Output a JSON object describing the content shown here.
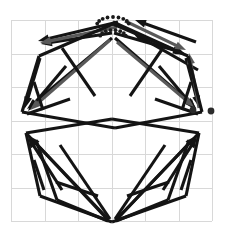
{
  "figure": {
    "width": 225,
    "height": 243,
    "background_color": "#ffffff"
  },
  "chart_data": {
    "type": "diagram",
    "xlabel": "",
    "ylabel": "",
    "grid": true,
    "grid_color": "#d8d8d8",
    "grid_spacing_px": 33.5,
    "grid_origin": [
      11,
      20
    ],
    "grid_cols": 6,
    "grid_rows": 6,
    "colors": {
      "primary_stroke": "#141414",
      "secondary_stroke": "#595959",
      "marker": "#2b2b2b",
      "grid": "#d8d8d8",
      "background": "#ffffff"
    },
    "vertices": [
      {
        "id": "top",
        "x": 113,
        "y": 24
      },
      {
        "id": "upper-left",
        "x": 39,
        "y": 56
      },
      {
        "id": "upper-right",
        "x": 188,
        "y": 56
      },
      {
        "id": "left",
        "x": 22,
        "y": 112
      },
      {
        "id": "right",
        "x": 202,
        "y": 112
      },
      {
        "id": "mid-left",
        "x": 26,
        "y": 133
      },
      {
        "id": "mid-right",
        "x": 199,
        "y": 133
      },
      {
        "id": "lower-left",
        "x": 40,
        "y": 196
      },
      {
        "id": "lower-right",
        "x": 186,
        "y": 196
      },
      {
        "id": "bottom",
        "x": 112,
        "y": 222
      }
    ],
    "markers": [
      {
        "id": "dot-right-inner",
        "x": 193,
        "y": 110,
        "r": 3.4,
        "color": "#2b2b2b"
      },
      {
        "id": "dot-right-outer",
        "x": 211,
        "y": 111,
        "r": 3.4,
        "color": "#2b2b2b"
      }
    ],
    "arcs": [
      {
        "id": "apex-arc-outer",
        "cx": 113,
        "cy": 25,
        "rx": 16,
        "ry": 8,
        "style": "dotted",
        "dots": 9
      },
      {
        "id": "apex-arc-inner",
        "cx": 113,
        "cy": 37,
        "rx": 13,
        "ry": 7,
        "style": "dotted",
        "dots": 8
      }
    ],
    "series": [
      {
        "name": "upper-left converging vectors",
        "color": "#141414",
        "arrowhead": true,
        "vectors": [
          {
            "x1": 118,
            "y1": 22,
            "x2": 38,
            "y2": 41
          },
          {
            "x1": 112,
            "y1": 33,
            "x2": 41,
            "y2": 44
          }
        ]
      },
      {
        "name": "upper-left gray vector",
        "color": "#595959",
        "arrowhead": true,
        "vectors": [
          {
            "x1": 117,
            "y1": 27,
            "x2": 40,
            "y2": 43
          }
        ]
      },
      {
        "name": "left vertex converging vectors",
        "color": "#141414",
        "arrowhead": true,
        "vectors": [
          {
            "x1": 112,
            "y1": 38,
            "x2": 27,
            "y2": 109
          },
          {
            "x1": 66,
            "y1": 66,
            "x2": 28,
            "y2": 111
          },
          {
            "x1": 40,
            "y1": 58,
            "x2": 25,
            "y2": 108
          }
        ]
      },
      {
        "name": "left vertex gray vector",
        "color": "#595959",
        "arrowhead": true,
        "vectors": [
          {
            "x1": 110,
            "y1": 40,
            "x2": 30,
            "y2": 110
          }
        ]
      },
      {
        "name": "upper-right converging vectors",
        "color": "#141414",
        "arrowhead": true,
        "vectors": [
          {
            "x1": 113,
            "y1": 22,
            "x2": 186,
            "y2": 55
          },
          {
            "x1": 114,
            "y1": 33,
            "x2": 184,
            "y2": 53
          }
        ]
      },
      {
        "name": "upper-right gray vector",
        "color": "#595959",
        "arrowhead": true,
        "vectors": [
          {
            "x1": 125,
            "y1": 21,
            "x2": 186,
            "y2": 50
          }
        ]
      },
      {
        "name": "right vertex converging vectors",
        "color": "#141414",
        "arrowhead": true,
        "vectors": [
          {
            "x1": 115,
            "y1": 38,
            "x2": 196,
            "y2": 108
          },
          {
            "x1": 159,
            "y1": 66,
            "x2": 196,
            "y2": 110
          },
          {
            "x1": 186,
            "y1": 58,
            "x2": 199,
            "y2": 107
          }
        ]
      },
      {
        "name": "right vertex gray vector",
        "color": "#595959",
        "arrowhead": true,
        "vectors": [
          {
            "x1": 117,
            "y1": 42,
            "x2": 194,
            "y2": 107
          }
        ]
      },
      {
        "name": "upper arrow to top-right reversed",
        "color": "#141414",
        "arrowhead": true,
        "vectors": [
          {
            "x1": 196,
            "y1": 42,
            "x2": 135,
            "y2": 20
          },
          {
            "x1": 198,
            "y1": 70,
            "x2": 133,
            "y2": 33
          }
        ]
      },
      {
        "name": "right up arrow",
        "color": "#595959",
        "arrowhead": true,
        "vectors": [
          {
            "x1": 199,
            "y1": 108,
            "x2": 189,
            "y2": 53
          }
        ]
      },
      {
        "name": "polygon outline upper",
        "color": "#141414",
        "arrowhead": false,
        "vectors": [
          {
            "x1": 39,
            "y1": 56,
            "x2": 22,
            "y2": 112
          },
          {
            "x1": 188,
            "y1": 56,
            "x2": 202,
            "y2": 112
          },
          {
            "x1": 113,
            "y1": 24,
            "x2": 39,
            "y2": 56
          },
          {
            "x1": 113,
            "y1": 24,
            "x2": 188,
            "y2": 56
          }
        ]
      },
      {
        "name": "mid lens edges",
        "color": "#141414",
        "arrowhead": false,
        "vectors": [
          {
            "x1": 22,
            "y1": 112,
            "x2": 115,
            "y2": 128
          },
          {
            "x1": 115,
            "y1": 128,
            "x2": 202,
            "y2": 112
          },
          {
            "x1": 26,
            "y1": 133,
            "x2": 112,
            "y2": 119
          },
          {
            "x1": 112,
            "y1": 119,
            "x2": 199,
            "y2": 133
          }
        ]
      },
      {
        "name": "lower-left polygon edges",
        "color": "#141414",
        "arrowhead": false,
        "vectors": [
          {
            "x1": 26,
            "y1": 133,
            "x2": 40,
            "y2": 196
          },
          {
            "x1": 40,
            "y1": 196,
            "x2": 112,
            "y2": 222
          },
          {
            "x1": 26,
            "y1": 133,
            "x2": 108,
            "y2": 220
          },
          {
            "x1": 60,
            "y1": 145,
            "x2": 110,
            "y2": 219
          },
          {
            "x1": 36,
            "y1": 140,
            "x2": 57,
            "y2": 200
          },
          {
            "x1": 57,
            "y1": 200,
            "x2": 108,
            "y2": 221
          }
        ]
      },
      {
        "name": "lower-right polygon edges",
        "color": "#141414",
        "arrowhead": false,
        "vectors": [
          {
            "x1": 199,
            "y1": 133,
            "x2": 186,
            "y2": 196
          },
          {
            "x1": 186,
            "y1": 196,
            "x2": 112,
            "y2": 222
          },
          {
            "x1": 199,
            "y1": 133,
            "x2": 116,
            "y2": 220
          },
          {
            "x1": 165,
            "y1": 145,
            "x2": 115,
            "y2": 219
          },
          {
            "x1": 189,
            "y1": 140,
            "x2": 168,
            "y2": 200
          },
          {
            "x1": 168,
            "y1": 200,
            "x2": 116,
            "y2": 221
          }
        ]
      },
      {
        "name": "lower-left converging up-arrows",
        "color": "#141414",
        "arrowhead": true,
        "vectors": [
          {
            "x1": 108,
            "y1": 219,
            "x2": 29,
            "y2": 136
          },
          {
            "x1": 62,
            "y1": 190,
            "x2": 28,
            "y2": 137
          }
        ]
      },
      {
        "name": "lower-right converging up-arrows",
        "color": "#141414",
        "arrowhead": true,
        "vectors": [
          {
            "x1": 117,
            "y1": 219,
            "x2": 196,
            "y2": 136
          },
          {
            "x1": 163,
            "y1": 190,
            "x2": 197,
            "y2": 137
          }
        ]
      },
      {
        "name": "inner upper-left chords",
        "color": "#141414",
        "arrowhead": false,
        "vectors": [
          {
            "x1": 62,
            "y1": 48,
            "x2": 95,
            "y2": 96
          },
          {
            "x1": 34,
            "y1": 82,
            "x2": 43,
            "y2": 110
          },
          {
            "x1": 70,
            "y1": 99,
            "x2": 27,
            "y2": 114
          }
        ]
      },
      {
        "name": "inner upper-right chords",
        "color": "#141414",
        "arrowhead": false,
        "vectors": [
          {
            "x1": 163,
            "y1": 48,
            "x2": 130,
            "y2": 96
          },
          {
            "x1": 191,
            "y1": 82,
            "x2": 182,
            "y2": 110
          },
          {
            "x1": 155,
            "y1": 99,
            "x2": 198,
            "y2": 114
          }
        ]
      },
      {
        "name": "inner lower-left chords",
        "color": "#141414",
        "arrowhead": false,
        "vectors": [
          {
            "x1": 34,
            "y1": 160,
            "x2": 44,
            "y2": 190
          },
          {
            "x1": 56,
            "y1": 182,
            "x2": 98,
            "y2": 196
          }
        ]
      },
      {
        "name": "inner lower-right chords",
        "color": "#141414",
        "arrowhead": false,
        "vectors": [
          {
            "x1": 191,
            "y1": 160,
            "x2": 181,
            "y2": 190
          },
          {
            "x1": 169,
            "y1": 182,
            "x2": 127,
            "y2": 196
          }
        ]
      }
    ]
  }
}
